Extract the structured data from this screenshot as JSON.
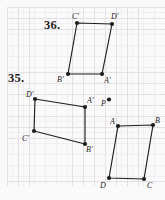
{
  "colors": {
    "paper": "#fbfafb",
    "grid_minor": "#f1eff3",
    "grid_major": "#e4e1e6",
    "ink": "#1f1c1c"
  },
  "problem_labels": [
    {
      "text": "36."
    },
    {
      "text": "35."
    }
  ],
  "figures": [
    {
      "name": "parallelogram-36",
      "kind": "polygon",
      "vertices": [
        {
          "label": "C′",
          "x": 77,
          "y": 23,
          "lx": 72,
          "ly": 19
        },
        {
          "label": "D′",
          "x": 112,
          "y": 24,
          "lx": 111,
          "ly": 19
        },
        {
          "label": "A′",
          "x": 102,
          "y": 74,
          "lx": 104,
          "ly": 83
        },
        {
          "label": "B′",
          "x": 68,
          "y": 74,
          "lx": 57,
          "ly": 82
        }
      ]
    },
    {
      "name": "parallelogram-35-image",
      "kind": "polygon",
      "vertices": [
        {
          "label": "D′",
          "x": 35,
          "y": 99,
          "lx": 26,
          "ly": 97
        },
        {
          "label": "A′",
          "x": 85,
          "y": 107,
          "lx": 87,
          "ly": 103
        },
        {
          "label": "B′",
          "x": 85,
          "y": 144,
          "lx": 86,
          "ly": 152
        },
        {
          "label": "C′",
          "x": 34,
          "y": 131,
          "lx": 22,
          "ly": 141
        }
      ]
    },
    {
      "name": "parallelogram-35-preimage",
      "kind": "polygon",
      "vertices": [
        {
          "label": "A",
          "x": 118,
          "y": 126,
          "lx": 110,
          "ly": 124
        },
        {
          "label": "B",
          "x": 153,
          "y": 125,
          "lx": 155,
          "ly": 123
        },
        {
          "label": "C",
          "x": 144,
          "y": 179,
          "lx": 147,
          "ly": 188
        },
        {
          "label": "D",
          "x": 109,
          "y": 178,
          "lx": 100,
          "ly": 188
        }
      ]
    },
    {
      "name": "point-p",
      "kind": "point",
      "vertices": [
        {
          "label": "P",
          "x": 109,
          "y": 99.5,
          "lx": 101,
          "ly": 106
        }
      ]
    }
  ]
}
